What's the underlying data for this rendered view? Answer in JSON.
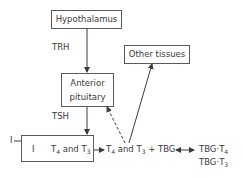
{
  "nodes": {
    "hypothalamus": "Hypothalamus",
    "anterior_pituitary_line1": "Anterior",
    "anterior_pituitary_line2": "pituitary",
    "other_tissues": "Other tissues"
  },
  "labels": {
    "trh": "TRH",
    "tsh": "TSH",
    "iodide_outside": "I",
    "iodide_inside": "I",
    "t4_t3_thyroid": {
      "t": "T",
      "s4": "4",
      "and": " and T",
      "s3": "3"
    },
    "t4_t3_free": {
      "t": "T",
      "s4": "4",
      "and": " and T",
      "s3": "3",
      "tbg": " + TBG"
    },
    "tbg_t4": {
      "prefix": "TBG·T",
      "sub": "4"
    },
    "tbg_t3": {
      "prefix": "TBG·T",
      "sub": "3"
    }
  },
  "colors": {
    "line": "#3a3a3a",
    "box_border": "#5a5a5a",
    "text": "#3a3a3a"
  }
}
